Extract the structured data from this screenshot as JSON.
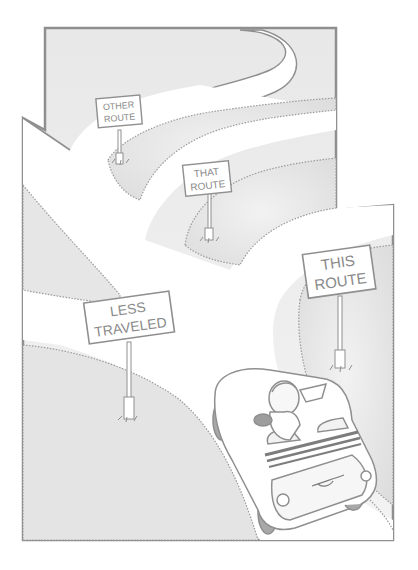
{
  "illustration": {
    "description": "Cartoon of a driver in a convertible car at a multi-way fork in a winding road, with route signs",
    "colors": {
      "line": "#8f8f8f",
      "shade": "#e4e4e4",
      "shade_light": "#efefef",
      "road": "#ffffff",
      "sign_text": "#8a8a8a",
      "car_dark": "#9a9a9a"
    },
    "signs": [
      {
        "id": "other-route",
        "line1": "OTHER",
        "line2": "ROUTE"
      },
      {
        "id": "that-route",
        "line1": "THAT",
        "line2": "ROUTE"
      },
      {
        "id": "less-traveled",
        "line1": "LESS",
        "line2": "TRAVELED"
      },
      {
        "id": "this-route",
        "line1": "THIS",
        "line2": "ROUTE"
      }
    ]
  }
}
